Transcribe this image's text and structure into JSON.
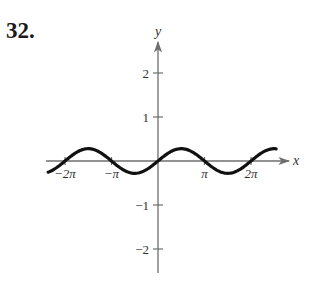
{
  "problem": {
    "number": "32."
  },
  "colors": {
    "axis": "#6e6e6e",
    "curve": "#111111",
    "text": "#333333"
  },
  "chart_data": {
    "type": "line",
    "title": "",
    "xlabel": "x",
    "ylabel": "y",
    "xlim": [
      -7.45,
      8.0
    ],
    "ylim": [
      -2.5,
      2.8
    ],
    "grid": false,
    "legend": null,
    "x_ticks": [
      {
        "value": -6.2832,
        "label": "−2π"
      },
      {
        "value": -3.1416,
        "label": "−π"
      },
      {
        "value": 3.1416,
        "label": "π"
      },
      {
        "value": 6.2832,
        "label": "2π"
      }
    ],
    "y_ticks": [
      {
        "value": 2,
        "label": "2"
      },
      {
        "value": 1,
        "label": "1"
      },
      {
        "value": -1,
        "label": "−1"
      },
      {
        "value": -2,
        "label": "−2"
      }
    ],
    "series": [
      {
        "name": "curve",
        "description": "sinusoid through origin, period 2π, amplitude ≈ 0.28",
        "amplitude": 0.28,
        "period": 6.2832,
        "x_range": [
          -7.42,
          7.98
        ],
        "x": [
          -7.42,
          -6.2832,
          -4.7124,
          -3.1416,
          -1.5708,
          0,
          1.5708,
          3.1416,
          4.7124,
          6.2832,
          7.98
        ],
        "y": [
          -0.25,
          0,
          0.28,
          0,
          -0.28,
          0,
          0.28,
          0,
          -0.28,
          0,
          0.28
        ]
      }
    ]
  }
}
